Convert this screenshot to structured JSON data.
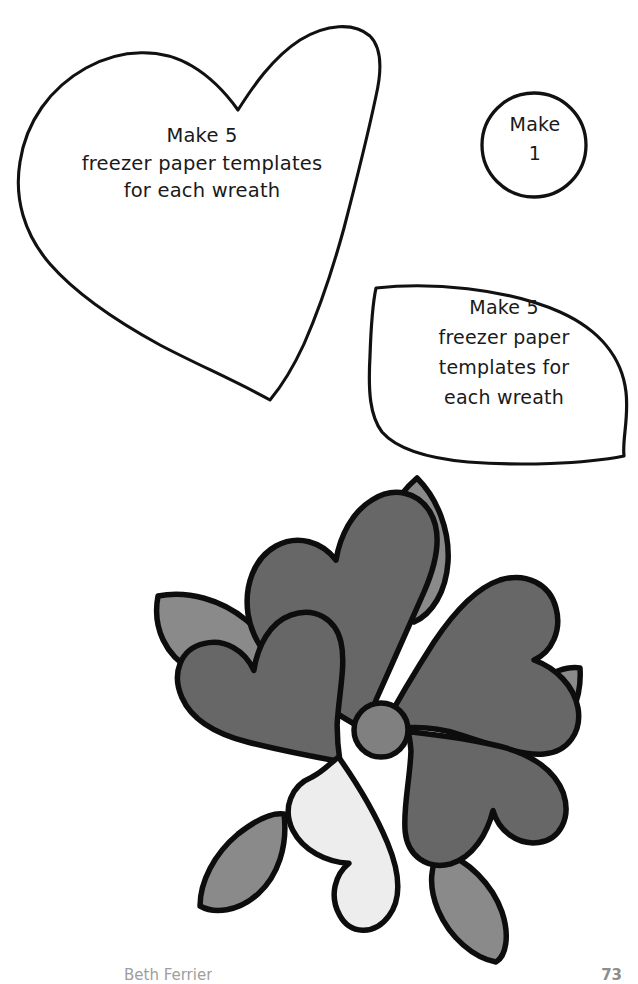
{
  "page": {
    "background_color": "#ffffff",
    "width": 638,
    "height": 984,
    "kind": "applique-pattern-template-sheet"
  },
  "templates": [
    {
      "id": "heart",
      "shape": "heart",
      "label": "Make 5\nfreezer paper templates\nfor each wreath",
      "stroke_color": "#111111",
      "fill_color": "#ffffff"
    },
    {
      "id": "circle",
      "shape": "circle",
      "label": "Make\n1",
      "stroke_color": "#111111",
      "fill_color": "#ffffff"
    },
    {
      "id": "leaf",
      "shape": "leaf",
      "label": "Make 5\nfreezer paper\ntemplates for\neach wreath",
      "stroke_color": "#111111",
      "fill_color": "#ffffff"
    }
  ],
  "illustration": {
    "name": "heart-flower-wreath-motif",
    "description": "Five heart petals pinwheeling around a round center, with five pointed leaves radiating outward",
    "colors": {
      "petal_dark": "#676767",
      "petal_light": "#ededed",
      "leaf": "#8a8a8a",
      "center": "#808080",
      "outline": "#0d0d0d"
    },
    "counts": {
      "petals": 5,
      "dark_petals": 4,
      "light_petals": 1,
      "leaves": 5,
      "centers": 1
    }
  },
  "footer": {
    "credit": "Beth Ferrier",
    "page_number": "73"
  }
}
